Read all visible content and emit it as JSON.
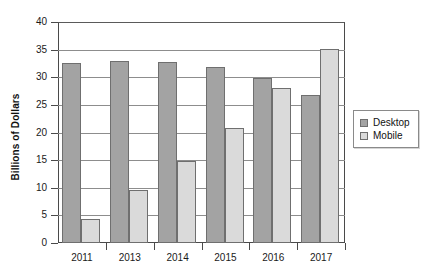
{
  "chart_data": {
    "type": "bar",
    "title": "",
    "xlabel": "",
    "ylabel": "Billions of Dollars",
    "categories": [
      "2011",
      "2013",
      "2014",
      "2015",
      "2016",
      "2017"
    ],
    "series": [
      {
        "name": "Desktop",
        "color": "#a3a3a3",
        "values": [
          32.5,
          33.0,
          32.8,
          31.9,
          29.8,
          26.7
        ]
      },
      {
        "name": "Mobile",
        "color": "#dadada",
        "values": [
          4.4,
          9.6,
          14.8,
          20.8,
          28.0,
          35.2
        ]
      }
    ],
    "ylim": [
      0,
      40
    ],
    "ytick_labels": [
      "40",
      "35",
      "30",
      "25",
      "20",
      "15",
      "10",
      "5",
      "0"
    ],
    "ytick_values": [
      40,
      35,
      30,
      25,
      20,
      15,
      10,
      5,
      0
    ],
    "grid": "horizontal",
    "legend_position": "right"
  }
}
